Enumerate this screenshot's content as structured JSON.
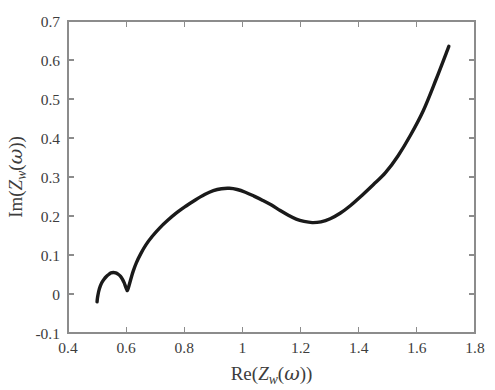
{
  "figure": {
    "background_color": "#ffffff",
    "axis_color": "#8c8c8c",
    "curve_color": "#1a1a1a",
    "text_color": "#3d3d3d"
  },
  "axes": {
    "x_title_parts": {
      "func": "Re(",
      "var": "Z",
      "sub": "w",
      "open": "(",
      "greek": "ω",
      "close": "))"
    },
    "y_title_parts": {
      "func": "Im(",
      "var": "Z",
      "sub": "w",
      "open": "(",
      "greek": "ω",
      "close": "))"
    },
    "x_title_plain": "Re(Z_w(ω))",
    "y_title_plain": "Im(Z_w(ω))",
    "x_ticks": [
      "0.4",
      "0.6",
      "0.8",
      "1",
      "1.2",
      "1.4",
      "1.6",
      "1.8"
    ],
    "y_ticks": [
      "0.7",
      "0.6",
      "0.5",
      "0.4",
      "0.3",
      "0.2",
      "0.1",
      "0",
      "-0.1"
    ]
  },
  "chart_data": {
    "type": "line",
    "title": "",
    "xlabel": "Re(Z_w(ω))",
    "ylabel": "Im(Z_w(ω))",
    "xlim": [
      0.4,
      1.8
    ],
    "ylim": [
      -0.1,
      0.7
    ],
    "xticks": [
      0.4,
      0.6,
      0.8,
      1.0,
      1.2,
      1.4,
      1.6,
      1.8
    ],
    "yticks": [
      -0.1,
      0.0,
      0.1,
      0.2,
      0.3,
      0.4,
      0.5,
      0.6,
      0.7
    ],
    "grid": false,
    "legend": null,
    "series": [
      {
        "name": "Z_w(ω)",
        "color": "#1a1a1a",
        "linewidth": 3.4,
        "x": [
          0.5,
          0.501,
          0.503,
          0.506,
          0.511,
          0.517,
          0.524,
          0.532,
          0.54,
          0.548,
          0.556,
          0.564,
          0.572,
          0.58,
          0.587,
          0.593,
          0.598,
          0.601,
          0.603,
          0.604,
          0.606,
          0.61,
          0.616,
          0.624,
          0.635,
          0.65,
          0.668,
          0.69,
          0.715,
          0.743,
          0.773,
          0.805,
          0.838,
          0.87,
          0.9,
          0.928,
          0.955,
          0.982,
          1.01,
          1.04,
          1.07,
          1.1,
          1.13,
          1.158,
          1.185,
          1.212,
          1.24,
          1.27,
          1.302,
          1.336,
          1.372,
          1.41,
          1.45,
          1.492,
          1.535,
          1.578,
          1.622,
          1.666,
          1.71
        ],
        "y": [
          -0.02,
          -0.012,
          -0.003,
          0.008,
          0.02,
          0.03,
          0.038,
          0.045,
          0.05,
          0.054,
          0.055,
          0.054,
          0.051,
          0.046,
          0.038,
          0.029,
          0.019,
          0.013,
          0.01,
          0.009,
          0.012,
          0.022,
          0.038,
          0.058,
          0.08,
          0.103,
          0.126,
          0.148,
          0.169,
          0.189,
          0.208,
          0.225,
          0.241,
          0.255,
          0.265,
          0.27,
          0.271,
          0.268,
          0.261,
          0.251,
          0.24,
          0.228,
          0.214,
          0.202,
          0.192,
          0.186,
          0.183,
          0.185,
          0.193,
          0.207,
          0.227,
          0.252,
          0.28,
          0.311,
          0.354,
          0.407,
          0.47,
          0.55,
          0.635
        ]
      }
    ],
    "annotations": [
      {
        "label": "small-loop-peak",
        "x": 0.556,
        "y": 0.055
      },
      {
        "label": "small-loop-cusp",
        "x": 0.604,
        "y": 0.009
      },
      {
        "label": "main-hump-peak",
        "x": 0.955,
        "y": 0.271
      },
      {
        "label": "valley-minimum",
        "x": 1.24,
        "y": 0.183
      },
      {
        "label": "curve-start",
        "x": 0.5,
        "y": -0.02
      },
      {
        "label": "curve-end",
        "x": 1.71,
        "y": 0.635
      }
    ]
  }
}
